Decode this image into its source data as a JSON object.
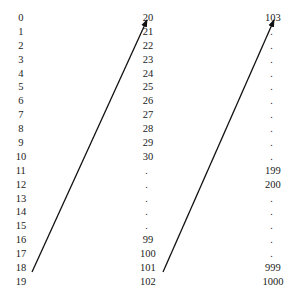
{
  "diagram": {
    "columns": [
      {
        "name": "column-1",
        "x": 21,
        "items": [
          {
            "label": "0",
            "y": 12
          },
          {
            "label": "1",
            "y": 26
          },
          {
            "label": "2",
            "y": 40
          },
          {
            "label": "3",
            "y": 54
          },
          {
            "label": "4",
            "y": 68
          },
          {
            "label": "5",
            "y": 81
          },
          {
            "label": "6",
            "y": 95
          },
          {
            "label": "7",
            "y": 109
          },
          {
            "label": "8",
            "y": 123
          },
          {
            "label": "9",
            "y": 137
          },
          {
            "label": "10",
            "y": 151
          },
          {
            "label": "11",
            "y": 165
          },
          {
            "label": "12",
            "y": 179
          },
          {
            "label": "13",
            "y": 193
          },
          {
            "label": "14",
            "y": 206
          },
          {
            "label": "15",
            "y": 220
          },
          {
            "label": "16",
            "y": 234
          },
          {
            "label": "17",
            "y": 248
          },
          {
            "label": "18",
            "y": 262
          },
          {
            "label": "19",
            "y": 276
          }
        ]
      },
      {
        "name": "column-2",
        "x": 148,
        "items": [
          {
            "label": "20",
            "y": 12
          },
          {
            "label": "21",
            "y": 26
          },
          {
            "label": "22",
            "y": 40
          },
          {
            "label": "23",
            "y": 54
          },
          {
            "label": "24",
            "y": 68
          },
          {
            "label": "25",
            "y": 81
          },
          {
            "label": "26",
            "y": 95
          },
          {
            "label": "27",
            "y": 109
          },
          {
            "label": "28",
            "y": 123
          },
          {
            "label": "29",
            "y": 137
          },
          {
            "label": "30",
            "y": 151
          },
          {
            "label": ".",
            "y": 165
          },
          {
            "label": ".",
            "y": 179
          },
          {
            "label": ".",
            "y": 193
          },
          {
            "label": ".",
            "y": 206
          },
          {
            "label": ".",
            "y": 220
          },
          {
            "label": "99",
            "y": 234
          },
          {
            "label": "100",
            "y": 248
          },
          {
            "label": "101",
            "y": 262
          },
          {
            "label": "102",
            "y": 276
          }
        ]
      },
      {
        "name": "column-3",
        "x": 273,
        "items": [
          {
            "label": "103",
            "y": 12
          },
          {
            "label": ".",
            "y": 26
          },
          {
            "label": ".",
            "y": 40
          },
          {
            "label": ".",
            "y": 54
          },
          {
            "label": ".",
            "y": 68
          },
          {
            "label": ".",
            "y": 81
          },
          {
            "label": ".",
            "y": 95
          },
          {
            "label": ".",
            "y": 109
          },
          {
            "label": ".",
            "y": 123
          },
          {
            "label": ".",
            "y": 137
          },
          {
            "label": ".",
            "y": 151
          },
          {
            "label": "199",
            "y": 165
          },
          {
            "label": "200",
            "y": 179
          },
          {
            "label": ".",
            "y": 193
          },
          {
            "label": ".",
            "y": 206
          },
          {
            "label": ".",
            "y": 220
          },
          {
            "label": ".",
            "y": 234
          },
          {
            "label": ".",
            "y": 248
          },
          {
            "label": "999",
            "y": 262
          },
          {
            "label": "1000",
            "y": 276
          }
        ]
      }
    ],
    "arrows": [
      {
        "from": "19",
        "to": "20",
        "x1": 32,
        "y1": 272,
        "x2": 147,
        "y2": 20
      },
      {
        "from": "102",
        "to": "103",
        "x1": 163,
        "y1": 272,
        "x2": 274,
        "y2": 20
      }
    ],
    "colors": {
      "text": "#222222",
      "arrow": "#111111",
      "background": "#ffffff"
    }
  }
}
